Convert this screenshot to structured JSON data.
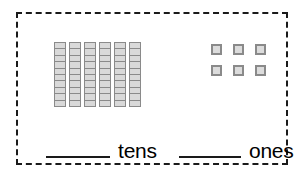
{
  "worksheet": {
    "frame_style": "dashed",
    "frame_color": "#1a1a1a",
    "background_color": "#ffffff"
  },
  "place_value": {
    "tens": {
      "rod_count": 6,
      "cells_per_rod": 10,
      "blank_value": "",
      "label": "tens",
      "block_fill_color": "#d9d9d9",
      "block_border_color": "#8a8a8a"
    },
    "ones": {
      "cube_count": 6,
      "columns": 3,
      "rows": 2,
      "blank_value": "",
      "label": "ones",
      "block_fill_color": "#dcdcdc",
      "block_border_color": "#8a8a8a"
    }
  }
}
